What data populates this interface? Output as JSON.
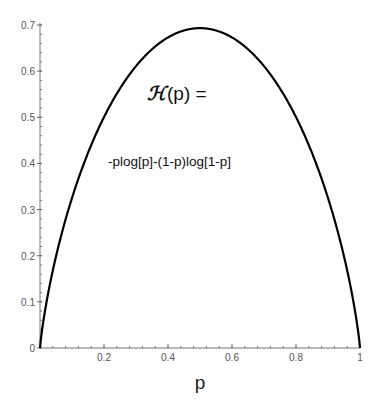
{
  "chart_data": {
    "type": "line",
    "title": "",
    "xlabel": "p",
    "ylabel": "",
    "xlim": [
      0,
      1
    ],
    "ylim": [
      0,
      0.7
    ],
    "grid": false,
    "x_ticks": [
      0.2,
      0.4,
      0.6,
      0.8,
      1
    ],
    "x_tick_labels": [
      "0.2",
      "0.4",
      "0.6",
      "0.8",
      "1"
    ],
    "y_ticks": [
      0,
      0.1,
      0.2,
      0.3,
      0.4,
      0.5,
      0.6,
      0.7
    ],
    "y_tick_labels": [
      "0",
      "0.1",
      "0.2",
      "0.3",
      "0.4",
      "0.5",
      "0.6",
      "0.7"
    ],
    "series": [
      {
        "name": "H(p)",
        "function": "-p*log(p)-(1-p)*log(1-p)",
        "color": "#000000",
        "x": [
          0.0,
          0.01,
          0.05,
          0.1,
          0.2,
          0.3,
          0.4,
          0.5,
          0.6,
          0.7,
          0.8,
          0.9,
          0.95,
          0.99,
          1.0
        ],
        "values": [
          0.0,
          0.056,
          0.199,
          0.325,
          0.5,
          0.611,
          0.673,
          0.693,
          0.673,
          0.611,
          0.5,
          0.325,
          0.199,
          0.056,
          0.0
        ]
      }
    ],
    "annotations": [
      {
        "text_symbol": "ℋ",
        "text_rest": "(p) =",
        "position": "upper-center"
      },
      {
        "text": "-plog[p]-(1-p)log[1-p]",
        "position": "center-left"
      }
    ]
  }
}
